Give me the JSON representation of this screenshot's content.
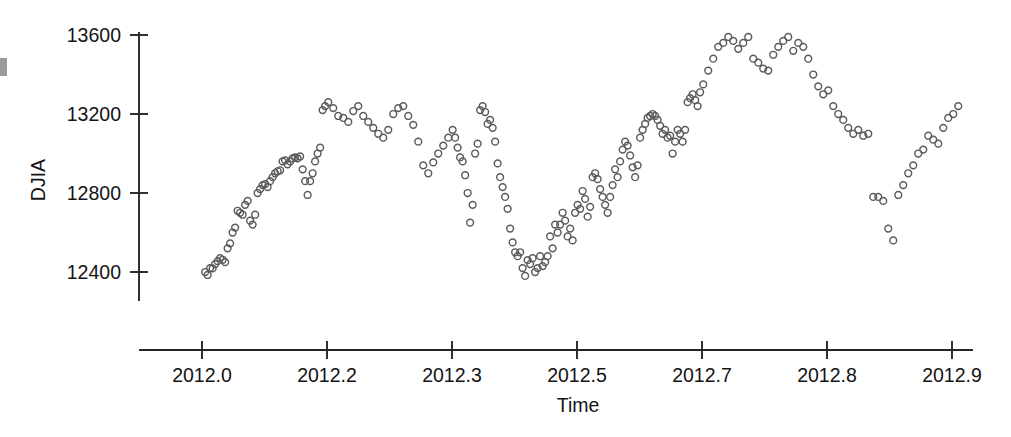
{
  "chart_data": {
    "type": "scatter",
    "title": "",
    "xlabel": "Time",
    "ylabel": "DJIA",
    "marker": "open-circle",
    "marker_color": "#5a5a5a",
    "grid": false,
    "legend": null,
    "xlim": [
      2011.96,
      2012.95
    ],
    "ylim": [
      12100,
      13750
    ],
    "xticks": [
      2012.0,
      2012.2,
      2012.3,
      2012.5,
      2012.7,
      2012.8,
      2012.9
    ],
    "xtick_labels": [
      "2012.0",
      "2012.2",
      "2012.3",
      "2012.5",
      "2012.7",
      "2012.8",
      "2012.9"
    ],
    "yticks": [
      12400,
      12800,
      13200,
      13600
    ],
    "ytick_labels": [
      "12400",
      "12800",
      "13200",
      "13600"
    ],
    "x": [
      2012.005,
      2012.009,
      2012.013,
      2012.017,
      2012.021,
      2012.025,
      2012.029,
      2012.033,
      2012.037,
      2012.041,
      2012.045,
      2012.049,
      2012.053,
      2012.057,
      2012.061,
      2012.065,
      2012.069,
      2012.073,
      2012.077,
      2012.081,
      2012.085,
      2012.089,
      2012.093,
      2012.097,
      2012.101,
      2012.105,
      2012.109,
      2012.113,
      2012.117,
      2012.121,
      2012.125,
      2012.129,
      2012.133,
      2012.137,
      2012.141,
      2012.145,
      2012.149,
      2012.153,
      2012.157,
      2012.161,
      2012.165,
      2012.169,
      2012.173,
      2012.177,
      2012.181,
      2012.185,
      2012.189,
      2012.193,
      2012.197,
      2012.201,
      2012.205,
      2012.209,
      2012.213,
      2012.217,
      2012.221,
      2012.225,
      2012.229,
      2012.233,
      2012.237,
      2012.241,
      2012.245,
      2012.249,
      2012.253,
      2012.257,
      2012.261,
      2012.265,
      2012.269,
      2012.273,
      2012.277,
      2012.281,
      2012.285,
      2012.289,
      2012.293,
      2012.297,
      2012.301,
      2012.305,
      2012.309,
      2012.313,
      2012.317,
      2012.321,
      2012.325,
      2012.329,
      2012.333,
      2012.337,
      2012.341,
      2012.345,
      2012.349,
      2012.353,
      2012.357,
      2012.361,
      2012.365,
      2012.369,
      2012.373,
      2012.377,
      2012.381,
      2012.385,
      2012.389,
      2012.393,
      2012.397,
      2012.401,
      2012.405,
      2012.409,
      2012.413,
      2012.417,
      2012.421,
      2012.425,
      2012.429,
      2012.433,
      2012.437,
      2012.441,
      2012.445,
      2012.449,
      2012.453,
      2012.457,
      2012.461,
      2012.465,
      2012.469,
      2012.473,
      2012.477,
      2012.481,
      2012.485,
      2012.489,
      2012.493,
      2012.497,
      2012.501,
      2012.505,
      2012.509,
      2012.513,
      2012.517,
      2012.521,
      2012.525,
      2012.529,
      2012.533,
      2012.537,
      2012.541,
      2012.545,
      2012.549,
      2012.553,
      2012.557,
      2012.561,
      2012.565,
      2012.569,
      2012.573,
      2012.577,
      2012.581,
      2012.585,
      2012.589,
      2012.593,
      2012.597,
      2012.601,
      2012.605,
      2012.609,
      2012.613,
      2012.617,
      2012.621,
      2012.625,
      2012.629,
      2012.633,
      2012.637,
      2012.641,
      2012.645,
      2012.649,
      2012.653,
      2012.657,
      2012.661,
      2012.665,
      2012.669,
      2012.673,
      2012.677,
      2012.681,
      2012.685,
      2012.689,
      2012.693,
      2012.697,
      2012.701,
      2012.705,
      2012.709,
      2012.713,
      2012.717,
      2012.721,
      2012.725,
      2012.729,
      2012.733,
      2012.737,
      2012.741,
      2012.745,
      2012.749,
      2012.753,
      2012.757,
      2012.761,
      2012.765,
      2012.769,
      2012.773,
      2012.777,
      2012.781,
      2012.785,
      2012.789,
      2012.793,
      2012.797,
      2012.801,
      2012.805,
      2012.809,
      2012.813,
      2012.817,
      2012.821,
      2012.825,
      2012.829,
      2012.833,
      2012.837,
      2012.841,
      2012.845,
      2012.849,
      2012.853,
      2012.857,
      2012.861,
      2012.865,
      2012.869,
      2012.873,
      2012.877,
      2012.881,
      2012.885,
      2012.889,
      2012.893,
      2012.897,
      2012.901,
      2012.905
    ],
    "y": [
      12400,
      12385,
      12420,
      12418,
      12440,
      12455,
      12470,
      12462,
      12450,
      12520,
      12545,
      12600,
      12625,
      12710,
      12700,
      12690,
      12740,
      12760,
      12660,
      12640,
      12690,
      12800,
      12820,
      12840,
      12845,
      12830,
      12860,
      12880,
      12900,
      12910,
      12915,
      12960,
      12965,
      12945,
      12960,
      12975,
      12980,
      12975,
      12985,
      12920,
      12860,
      12790,
      12860,
      12900,
      12960,
      13000,
      13030,
      13220,
      13240,
      13260,
      13230,
      13190,
      13180,
      13160,
      13215,
      13240,
      13190,
      13160,
      13130,
      13100,
      13080,
      13120,
      13200,
      13230,
      13240,
      13190,
      13145,
      13060,
      12940,
      12900,
      12955,
      13000,
      13040,
      13080,
      13120,
      13080,
      13030,
      12980,
      12960,
      12890,
      12800,
      12650,
      12740,
      13000,
      13050,
      13220,
      13240,
      13210,
      13150,
      13170,
      13130,
      13060,
      12950,
      12880,
      12830,
      12780,
      12720,
      12620,
      12550,
      12500,
      12480,
      12500,
      12420,
      12380,
      12460,
      12440,
      12470,
      12400,
      12420,
      12480,
      12430,
      12450,
      12480,
      12580,
      12520,
      12640,
      12600,
      12640,
      12700,
      12660,
      12580,
      12620,
      12560,
      12700,
      12740,
      12720,
      12810,
      12770,
      12680,
      12730,
      12880,
      12900,
      12870,
      12820,
      12780,
      12740,
      12700,
      12780,
      12840,
      12920,
      12880,
      12960,
      13020,
      13060,
      13040,
      12990,
      12930,
      12880,
      12940,
      13080,
      13120,
      13150,
      13180,
      13190,
      13200,
      13190,
      13170,
      13140,
      13100,
      13120,
      13080,
      13090,
      13000,
      13060,
      13120,
      13100,
      13060,
      13120,
      13260,
      13280,
      13300,
      13270,
      13240,
      13310,
      13350,
      13420,
      13480,
      13540,
      13560,
      13590,
      13570,
      13530,
      13560,
      13590,
      13480,
      13460,
      13430,
      13420,
      13500,
      13540,
      13570,
      13590,
      13520,
      13560,
      13540,
      13480,
      13400,
      13340,
      13300,
      13320,
      13240,
      13200,
      13170,
      13130,
      13100,
      13120,
      13090,
      13100,
      12780,
      12780,
      12760,
      12620,
      12560,
      12790,
      12840,
      12900,
      12940,
      13000,
      13020,
      13090,
      13070,
      13050,
      13130,
      13180,
      13200,
      13240,
      13300,
      13330,
      13220,
      13190,
      13180,
      13170,
      13150,
      13130,
      12950
    ]
  }
}
